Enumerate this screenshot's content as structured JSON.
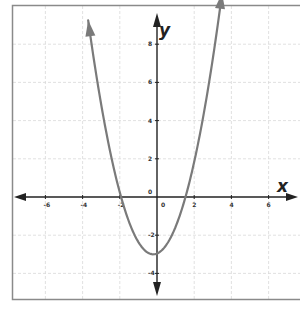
{
  "chart_data": {
    "type": "line",
    "title": "",
    "xlabel": "x",
    "ylabel": "y",
    "xlim": [
      -7.5,
      7.5
    ],
    "ylim": [
      -5.5,
      10
    ],
    "grid": true,
    "legend": null,
    "x_ticks": [
      -6,
      -4,
      -2,
      0,
      2,
      4,
      6
    ],
    "y_ticks": [
      -4,
      -2,
      0,
      2,
      4,
      6,
      8
    ],
    "x_tick_labels": [
      "-6",
      "-4",
      "-2",
      "0",
      "2",
      "4",
      "6"
    ],
    "y_tick_labels": [
      "-4",
      "-2",
      "0",
      "2",
      "4",
      "6",
      "8"
    ],
    "series": [
      {
        "name": "parabola",
        "equation_estimate": "y = (x + 0.2)^2 - 3",
        "vertex": [
          -0.2,
          -3
        ],
        "x_intercepts": [
          -1.9,
          1.5
        ],
        "y_intercept": -2.96,
        "x": [
          -3.7,
          -3,
          -2,
          -1.9,
          -1,
          -0.2,
          0,
          1,
          1.5,
          2,
          3,
          3.5
        ],
        "y": [
          9.25,
          4.84,
          0.24,
          0.0,
          -2.36,
          -3.0,
          -2.96,
          -1.56,
          0.0,
          1.84,
          7.24,
          10.0
        ],
        "color": "#7a7a7a",
        "ends_with_arrows": true
      }
    ],
    "axes_color": "#222222",
    "grid_color": "#d9d9d9",
    "frame_color": "#8a8a8a"
  }
}
